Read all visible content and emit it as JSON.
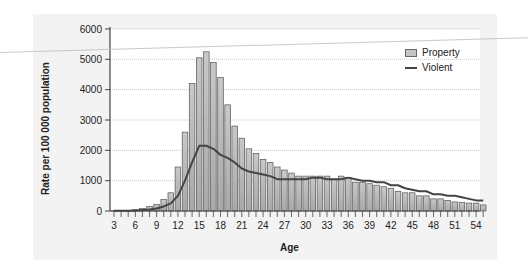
{
  "chart_data": {
    "type": "bar",
    "title": "",
    "xlabel": "Age",
    "ylabel": "Rate per 100 000 population",
    "ylim": [
      0,
      6000
    ],
    "yticks": [
      0,
      1000,
      2000,
      3000,
      4000,
      5000,
      6000
    ],
    "xticks": [
      3,
      6,
      9,
      12,
      15,
      18,
      21,
      24,
      27,
      30,
      33,
      36,
      39,
      42,
      45,
      48,
      51,
      54
    ],
    "grid": true,
    "legend_position": "upper right",
    "x": [
      3,
      4,
      5,
      6,
      7,
      8,
      9,
      10,
      11,
      12,
      13,
      14,
      15,
      16,
      17,
      18,
      19,
      20,
      21,
      22,
      23,
      24,
      25,
      26,
      27,
      28,
      29,
      30,
      31,
      32,
      33,
      34,
      35,
      36,
      37,
      38,
      39,
      40,
      41,
      42,
      43,
      44,
      45,
      46,
      47,
      48,
      49,
      50,
      51,
      52,
      53,
      54,
      55
    ],
    "series": [
      {
        "name": "Property",
        "type": "bar",
        "values": [
          5,
          10,
          20,
          40,
          80,
          150,
          220,
          380,
          600,
          1450,
          2600,
          4200,
          5050,
          5250,
          4900,
          4400,
          3500,
          2800,
          2400,
          2050,
          1900,
          1700,
          1600,
          1450,
          1350,
          1250,
          1150,
          1150,
          1150,
          1150,
          1150,
          1050,
          1150,
          1100,
          950,
          950,
          900,
          850,
          800,
          750,
          650,
          600,
          600,
          500,
          500,
          400,
          400,
          350,
          300,
          280,
          260,
          260,
          200
        ]
      },
      {
        "name": "Violent",
        "type": "line",
        "values": [
          5,
          5,
          10,
          20,
          30,
          50,
          80,
          150,
          250,
          500,
          1000,
          1600,
          2150,
          2150,
          2050,
          1850,
          1750,
          1600,
          1400,
          1300,
          1250,
          1200,
          1150,
          1050,
          1050,
          1050,
          1050,
          1050,
          1100,
          1100,
          1050,
          1050,
          1050,
          1100,
          1050,
          1000,
          1000,
          950,
          950,
          850,
          850,
          750,
          700,
          650,
          650,
          550,
          550,
          500,
          500,
          450,
          400,
          350,
          350
        ]
      }
    ]
  },
  "legend": {
    "items": [
      {
        "label": "Property"
      },
      {
        "label": "Violent"
      }
    ]
  },
  "axes": {
    "xlabel": "Age",
    "ylabel": "Rate per 100 000 population"
  }
}
